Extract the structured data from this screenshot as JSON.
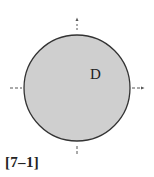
{
  "figure": {
    "region_label": "D",
    "caption": "[7–1]",
    "disc": {
      "cx": 77,
      "cy": 88,
      "r": 53,
      "fill": "#cfcfcf",
      "stroke": "#333333"
    },
    "axis_color": "#555555",
    "axes": [
      {
        "name": "top-axis-tick",
        "direction": "up",
        "arrow": true
      },
      {
        "name": "right-axis-tick",
        "direction": "right",
        "arrow": true
      },
      {
        "name": "bottom-axis-tick",
        "direction": "down",
        "arrow": false
      },
      {
        "name": "left-axis-tick",
        "direction": "left",
        "arrow": false
      }
    ]
  }
}
